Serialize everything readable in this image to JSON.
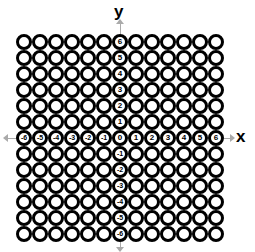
{
  "diagram": {
    "axis_labels": {
      "x": "x",
      "y": "y"
    },
    "grid": {
      "rows": 13,
      "cols": 13,
      "cell_size_px": 16
    },
    "x_axis_ticks": [
      "-6",
      "-5",
      "-4",
      "-3",
      "-2",
      "-1",
      "0",
      "1",
      "2",
      "3",
      "4",
      "5",
      "6"
    ],
    "y_axis_ticks": [
      "6",
      "5",
      "4",
      "3",
      "2",
      "1",
      "0",
      "-1",
      "-2",
      "-3",
      "-4",
      "-5",
      "-6"
    ],
    "colors": {
      "ring": "#000000",
      "fill": "#ffffff",
      "arrow": "#aaaaaa"
    }
  }
}
